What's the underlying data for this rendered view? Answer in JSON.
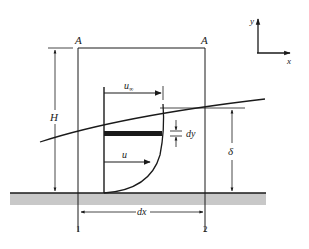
{
  "diagram": {
    "colors": {
      "line": "#1a1a1a",
      "plate": "#c8c8c8",
      "background": "#ffffff"
    },
    "labels": {
      "section_top_left": "A",
      "section_top_right": "A",
      "height": "H",
      "free_stream_velocity": "u",
      "free_stream_subscript": "∞",
      "local_velocity": "u",
      "element_thickness": "dy",
      "boundary_layer_thickness": "δ",
      "element_length": "dx",
      "station_1": "1",
      "station_2": "2",
      "axis_x": "x",
      "axis_y": "y"
    }
  }
}
